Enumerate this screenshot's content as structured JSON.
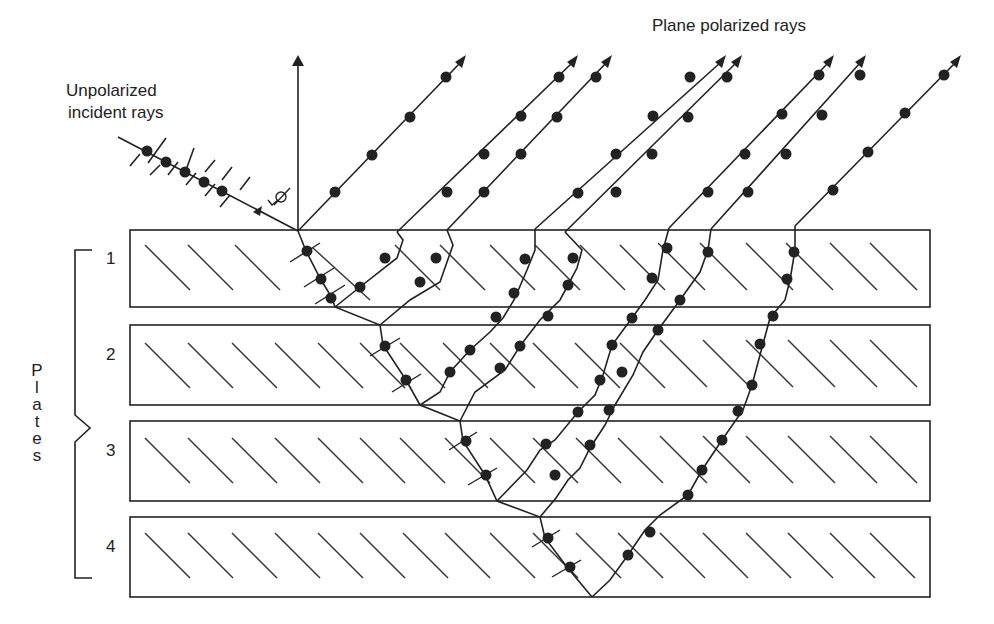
{
  "labels": {
    "title_top_right": "Plane polarized rays",
    "incident_line1": "Unpolarized",
    "incident_line2": "incident rays",
    "angle_symbol": "φ",
    "plates_label": "Plates",
    "plates_letters": [
      "P",
      "l",
      "a",
      "t",
      "e",
      "s"
    ],
    "plate_numbers": [
      "1",
      "2",
      "3",
      "4"
    ]
  },
  "colors": {
    "ink": "#222222",
    "background": "#ffffff"
  },
  "geometry": {
    "plates": [
      {
        "number": "1",
        "x": 130,
        "y": 230,
        "w": 800,
        "h": 77
      },
      {
        "number": "2",
        "x": 130,
        "y": 325,
        "w": 800,
        "h": 80
      },
      {
        "number": "3",
        "x": 130,
        "y": 421,
        "w": 800,
        "h": 80
      },
      {
        "number": "4",
        "x": 130,
        "y": 517,
        "w": 800,
        "h": 80
      }
    ],
    "incident_ray": {
      "from": [
        120,
        140
      ],
      "to": [
        298,
        231
      ]
    },
    "normal": {
      "from": [
        298,
        231
      ],
      "to": [
        298,
        55
      ]
    },
    "reflected_ray_count": 11
  }
}
